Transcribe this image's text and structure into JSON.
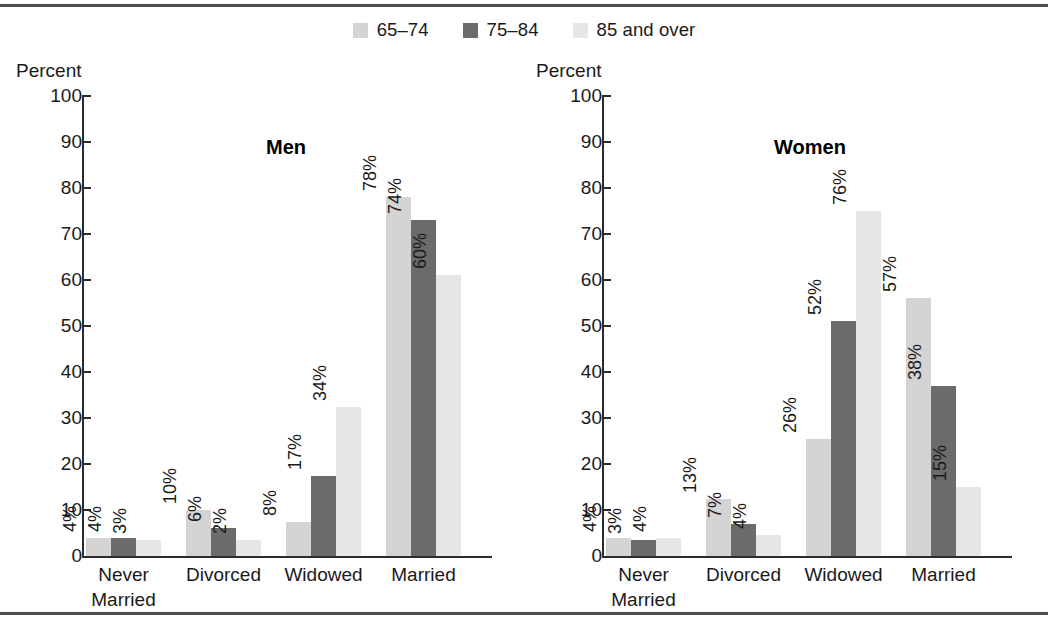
{
  "legend": {
    "items": [
      {
        "label": "65–74",
        "color": "#d4d4d4",
        "key": "a65_74"
      },
      {
        "label": "75–84",
        "color": "#6b6b6b",
        "key": "a75_84"
      },
      {
        "label": "85 and over",
        "color": "#e6e6e6",
        "key": "a85plus"
      }
    ]
  },
  "axis": {
    "caption": "Percent",
    "ticks": [
      "100",
      "90",
      "80",
      "70",
      "60",
      "50",
      "40",
      "30",
      "20",
      "10",
      "0"
    ]
  },
  "panels": [
    {
      "title": "Men"
    },
    {
      "title": "Women"
    }
  ],
  "chart_data": {
    "type": "bar",
    "title": "",
    "xlabel": "",
    "ylabel": "Percent",
    "ylim": [
      0,
      100
    ],
    "ytick_step": 10,
    "grid": false,
    "legend_position": "top-center",
    "categories": [
      "Never\nMarried",
      "Divorced",
      "Widowed",
      "Married"
    ],
    "panels": [
      {
        "name": "Men",
        "series": [
          {
            "name": "65–74",
            "color": "#d4d4d4",
            "values": [
              4,
              10,
              8,
              78
            ],
            "labels": [
              "4%",
              "10%",
              "8%",
              "78%"
            ],
            "bar_heights": [
              4,
              10,
              7.5,
              78
            ]
          },
          {
            "name": "75–84",
            "color": "#6b6b6b",
            "values": [
              4,
              6,
              17,
              74
            ],
            "labels": [
              "4%",
              "6%",
              "17%",
              "74%"
            ],
            "bar_heights": [
              4,
              6,
              17.5,
              73
            ]
          },
          {
            "name": "85 and over",
            "color": "#e6e6e6",
            "values": [
              3,
              2,
              34,
              60
            ],
            "labels": [
              "3%",
              "2%",
              "34%",
              "60%"
            ],
            "bar_heights": [
              3.5,
              3.5,
              32.5,
              61
            ]
          }
        ]
      },
      {
        "name": "Women",
        "series": [
          {
            "name": "65–74",
            "color": "#d4d4d4",
            "values": [
              4,
              13,
              26,
              57
            ],
            "labels": [
              "4%",
              "13%",
              "26%",
              "57%"
            ],
            "bar_heights": [
              4,
              12.5,
              25.5,
              56
            ]
          },
          {
            "name": "75–84",
            "color": "#6b6b6b",
            "values": [
              3,
              7,
              52,
              38
            ],
            "labels": [
              "3%",
              "7%",
              "52%",
              "38%"
            ],
            "bar_heights": [
              3.5,
              7,
              51,
              37
            ]
          },
          {
            "name": "85 and over",
            "color": "#e6e6e6",
            "values": [
              4,
              4,
              76,
              15
            ],
            "labels": [
              "4%",
              "4%",
              "76%",
              "15%"
            ],
            "bar_heights": [
              4,
              4.5,
              75,
              15
            ]
          }
        ]
      }
    ]
  }
}
